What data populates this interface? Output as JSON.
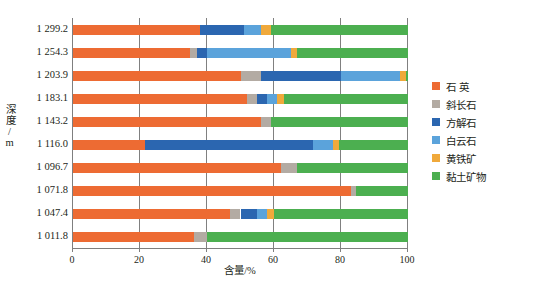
{
  "chart_data": {
    "type": "bar",
    "orientation": "horizontal",
    "stacked": true,
    "title": "",
    "xlabel": "含量/%",
    "ylabel": "深度/m",
    "xlim": [
      0,
      100
    ],
    "xticks": [
      0,
      20,
      40,
      60,
      80,
      100
    ],
    "grid": "vertical",
    "legend_position": "right",
    "categories": [
      "1 299.2",
      "1 254.3",
      "1 203.9",
      "1 183.1",
      "1 143.2",
      "1 116.0",
      "1 096.7",
      "1 071.8",
      "1 047.4",
      "1 011.8"
    ],
    "series": [
      {
        "name": "石  英",
        "color": "#ED6B33",
        "values": [
          38.0,
          35.0,
          50.0,
          52.0,
          56.0,
          21.5,
          62.0,
          83.0,
          47.0,
          36.0
        ]
      },
      {
        "name": "斜长石",
        "color": "#B3ABA3",
        "values": [
          0.0,
          2.0,
          6.0,
          3.0,
          3.0,
          0.0,
          5.0,
          1.5,
          3.0,
          4.0
        ]
      },
      {
        "name": "方解石",
        "color": "#2B66B0",
        "values": [
          13.0,
          3.0,
          24.0,
          3.0,
          0.0,
          50.0,
          0.0,
          0.0,
          5.0,
          0.0
        ]
      },
      {
        "name": "白云石",
        "color": "#5BA3DB",
        "values": [
          5.0,
          25.0,
          17.5,
          3.0,
          0.0,
          6.0,
          0.0,
          0.0,
          3.0,
          0.0
        ]
      },
      {
        "name": "黄铁矿",
        "color": "#F0A93B",
        "values": [
          3.0,
          2.0,
          2.0,
          2.0,
          0.0,
          2.0,
          0.0,
          0.0,
          2.0,
          0.0
        ]
      },
      {
        "name": "黏土矿物",
        "color": "#4CAF50",
        "values": [
          41.0,
          33.0,
          0.5,
          37.0,
          41.0,
          20.5,
          33.0,
          15.5,
          40.0,
          60.0
        ]
      }
    ]
  },
  "caption": "",
  "axis": {
    "x_title": "含量/%",
    "y_title": "深度/m"
  }
}
